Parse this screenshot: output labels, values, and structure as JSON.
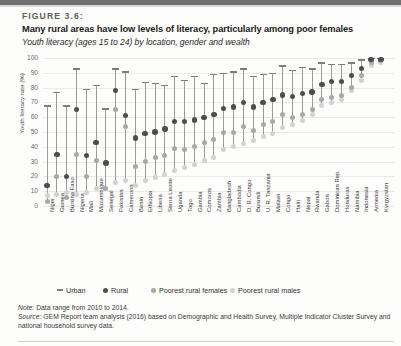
{
  "figure": {
    "label": "FIGURE 3.6:",
    "title": "Many rural areas have low levels of literacy, particularly among poor females",
    "subtitle": "Youth literacy (ages 15 to 24) by location, gender and wealth"
  },
  "notes": {
    "note_prefix": "Note:",
    "note_text": " Data range from 2010 to 2014.",
    "source_prefix": "Source:",
    "source_text": " GEM Report team analysis (2016) based on Demographic and Health Survey, Multiple Indicator Cluster Survey and national household survey data."
  },
  "legend": {
    "items": [
      {
        "label": "Urban",
        "mark": "line",
        "color": "#7d7d7d"
      },
      {
        "label": "Rural",
        "mark": "circle",
        "color": "#4d4d4d"
      },
      {
        "label": "Poorest rural females",
        "mark": "circle",
        "color": "#a8a8a8"
      },
      {
        "label": "Poorest rural males",
        "mark": "circle",
        "color": "#d2d2d2"
      }
    ]
  },
  "chart_data": {
    "type": "scatter",
    "title": "Many rural areas have low levels of literacy, particularly among poor females",
    "subtitle": "Youth literacy (ages 15 to 24) by location, gender and wealth",
    "xlabel": "",
    "ylabel": "Youth literacy rate (%)",
    "ylim": [
      0,
      100
    ],
    "yticks": [
      0,
      10,
      20,
      30,
      40,
      50,
      60,
      70,
      80,
      90,
      100
    ],
    "grid": true,
    "legend_position": "bottom",
    "categories": [
      "Niger",
      "Guinea",
      "Burkina Faso",
      "Nigeria",
      "Mali",
      "Mozambique",
      "Senegal",
      "Pakistan",
      "Cameroon",
      "Benin",
      "Ethiopia",
      "Liberia",
      "Sierra Leone",
      "Uganda",
      "Togo",
      "Gambia",
      "Comoros",
      "Zambia",
      "Bangladesh",
      "Cambodia",
      "D. R. Congo",
      "Burundi",
      "U. R. Tanzania",
      "Malawi",
      "Congo",
      "Haiti",
      "Nepal",
      "Rwanda",
      "Gabon",
      "Dominican Rep.",
      "Honduras",
      "Namibia",
      "Indonesia",
      "Armenia",
      "Kyrgyzstan"
    ],
    "series": [
      {
        "name": "Urban",
        "marker": "cap",
        "color": "#7d7d7d",
        "values": [
          68,
          77,
          68,
          93,
          79,
          82,
          66,
          93,
          91,
          79,
          84,
          83,
          82,
          88,
          85,
          88,
          83,
          89,
          90,
          91,
          93,
          88,
          89,
          90,
          95,
          92,
          94,
          93,
          97,
          96,
          96,
          97,
          99,
          100,
          100
        ]
      },
      {
        "name": "Rural",
        "marker": "circle",
        "color": "#4d4d4d",
        "values": [
          14,
          35,
          20,
          65,
          34,
          43,
          29,
          78,
          61,
          46,
          49,
          50,
          52,
          57,
          57,
          58,
          60,
          62,
          66,
          67,
          70,
          67,
          70,
          72,
          75,
          74,
          76,
          77,
          82,
          84,
          84,
          88,
          93,
          99,
          99
        ]
      },
      {
        "name": "Poorest rural females",
        "marker": "circle",
        "color": "#a8a8a8",
        "values": [
          3,
          20,
          6,
          35,
          20,
          31,
          12,
          65,
          54,
          27,
          30,
          33,
          34,
          39,
          38,
          40,
          43,
          45,
          50,
          50,
          54,
          51,
          55,
          57,
          62,
          60,
          62,
          65,
          72,
          73,
          75,
          80,
          88,
          97,
          98
        ]
      },
      {
        "name": "Poorest rural males",
        "marker": "circle",
        "color": "#d2d2d2",
        "values": [
          7,
          8,
          9,
          8,
          9,
          12,
          12,
          16,
          17,
          14,
          17,
          19,
          21,
          24,
          26,
          28,
          31,
          33,
          38,
          40,
          42,
          44,
          47,
          49,
          53,
          55,
          58,
          62,
          68,
          70,
          72,
          78,
          85,
          95,
          97
        ]
      }
    ]
  }
}
